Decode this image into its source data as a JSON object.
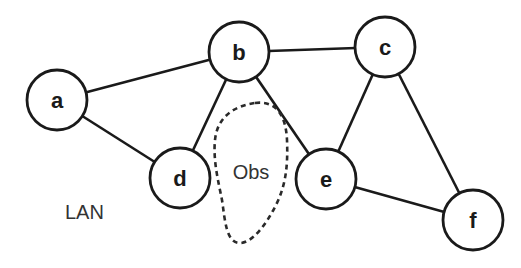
{
  "diagram": {
    "title_label": "LAN",
    "obstacle": {
      "label": "Obs"
    },
    "nodes": [
      {
        "id": "a",
        "label": "a",
        "x": 57,
        "y": 100
      },
      {
        "id": "b",
        "label": "b",
        "x": 239,
        "y": 52
      },
      {
        "id": "c",
        "label": "c",
        "x": 385,
        "y": 47
      },
      {
        "id": "d",
        "label": "d",
        "x": 180,
        "y": 178
      },
      {
        "id": "e",
        "label": "e",
        "x": 326,
        "y": 179
      },
      {
        "id": "f",
        "label": "f",
        "x": 473,
        "y": 220
      }
    ],
    "edges": [
      {
        "from": "a",
        "to": "b"
      },
      {
        "from": "a",
        "to": "d"
      },
      {
        "from": "b",
        "to": "c"
      },
      {
        "from": "b",
        "to": "d"
      },
      {
        "from": "b",
        "to": "e"
      },
      {
        "from": "c",
        "to": "e"
      },
      {
        "from": "c",
        "to": "f"
      },
      {
        "from": "e",
        "to": "f"
      }
    ]
  }
}
